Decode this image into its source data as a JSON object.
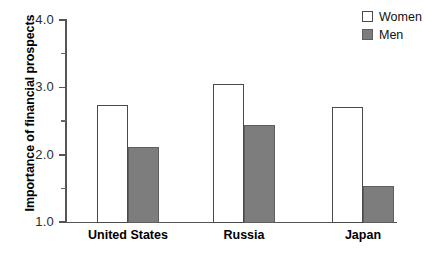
{
  "chart_data": {
    "type": "bar",
    "title": "",
    "xlabel": "",
    "ylabel": "Importance of financial prospects",
    "categories": [
      "United States",
      "Russia",
      "Japan"
    ],
    "series": [
      {
        "name": "Women",
        "values": [
          2.75,
          3.05,
          2.72
        ],
        "color": "#ffffff"
      },
      {
        "name": "Men",
        "values": [
          2.13,
          2.45,
          1.55
        ],
        "color": "#7d7d7d"
      }
    ],
    "ylim": [
      1.0,
      4.0
    ],
    "y_ticks_major": [
      "1.0",
      "2.0",
      "3.0",
      "4.0"
    ],
    "y_ticks_minor": [
      "1.5",
      "2.5",
      "3.5"
    ],
    "grid": false,
    "legend_position": "top-right"
  },
  "axis": {
    "y_title": "Importance of financial prospects",
    "tick_4_0": "4.0",
    "tick_3_0": "3.0",
    "tick_2_0": "2.0",
    "tick_1_0": "1.0"
  },
  "categories": {
    "c0": "United States",
    "c1": "Russia",
    "c2": "Japan"
  },
  "legend": {
    "women_label": "Women",
    "men_label": "Men"
  }
}
